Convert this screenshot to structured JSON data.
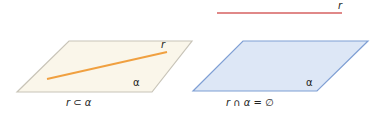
{
  "figures": [
    {
      "id": "contained",
      "plane_label": "α",
      "line_label": "r",
      "caption": "r ⊂ α",
      "plane_fill": "#faf6ea",
      "plane_stroke": "#c8c4b8",
      "line_color": "#f0a040"
    },
    {
      "id": "disjoint",
      "plane_label": "α",
      "line_label": "r",
      "caption": "r ∩ α = ∅",
      "plane_fill": "#dde7f6",
      "plane_stroke": "#7f9fd4",
      "line_color": "#d66060"
    }
  ]
}
